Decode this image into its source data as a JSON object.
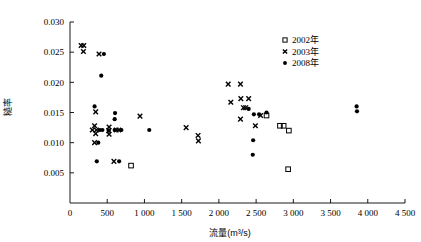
{
  "chart_data": {
    "type": "scatter",
    "title": "",
    "xlabel": "流量(m³/s)",
    "ylabel": "糙率",
    "xlim": [
      0,
      4500
    ],
    "ylim": [
      0,
      0.03
    ],
    "grid": false,
    "legend_position": "top-right",
    "xticks": [
      0,
      500,
      1000,
      1500,
      2000,
      2500,
      3000,
      3500,
      4000,
      4500
    ],
    "xticklabels": [
      "0",
      "500",
      "1 000",
      "1 500",
      "2 000",
      "2 500",
      "3 000",
      "3 500",
      "4 000",
      "4 500"
    ],
    "yticks": [
      0.005,
      0.01,
      0.015,
      0.02,
      0.025,
      0.03
    ],
    "yticklabels": [
      "0.005",
      "0.010",
      "0.015",
      "0.020",
      "0.025",
      "0.030"
    ],
    "series": [
      {
        "name": "2002年",
        "marker": "square",
        "color": "#000000",
        "points": [
          [
            820,
            0.0062
          ],
          [
            2640,
            0.0145
          ],
          [
            2820,
            0.0128
          ],
          [
            2870,
            0.0128
          ],
          [
            2940,
            0.012
          ],
          [
            2930,
            0.0056
          ]
        ]
      },
      {
        "name": "2003年",
        "marker": "x",
        "color": "#000000",
        "points": [
          [
            150,
            0.0261
          ],
          [
            185,
            0.0261
          ],
          [
            180,
            0.0251
          ],
          [
            390,
            0.0247
          ],
          [
            345,
            0.0151
          ],
          [
            330,
            0.0128
          ],
          [
            300,
            0.0121
          ],
          [
            355,
            0.0121
          ],
          [
            345,
            0.0115
          ],
          [
            330,
            0.01
          ],
          [
            520,
            0.012
          ],
          [
            525,
            0.0126
          ],
          [
            525,
            0.0114
          ],
          [
            620,
            0.0121
          ],
          [
            655,
            0.0121
          ],
          [
            590,
            0.0069
          ],
          [
            940,
            0.0144
          ],
          [
            1560,
            0.0125
          ],
          [
            1720,
            0.0112
          ],
          [
            1725,
            0.0103
          ],
          [
            2125,
            0.0197
          ],
          [
            2290,
            0.0197
          ],
          [
            2295,
            0.0173
          ],
          [
            2400,
            0.0173
          ],
          [
            2160,
            0.0167
          ],
          [
            2330,
            0.0158
          ],
          [
            2360,
            0.0158
          ],
          [
            2290,
            0.0139
          ],
          [
            2490,
            0.0128
          ],
          [
            2560,
            0.0145
          ]
        ]
      },
      {
        "name": "2008年",
        "marker": "dot",
        "color": "#000000",
        "points": [
          [
            455,
            0.0247
          ],
          [
            420,
            0.0211
          ],
          [
            330,
            0.016
          ],
          [
            605,
            0.0149
          ],
          [
            600,
            0.0139
          ],
          [
            400,
            0.0121
          ],
          [
            435,
            0.0121
          ],
          [
            520,
            0.012
          ],
          [
            600,
            0.0121
          ],
          [
            690,
            0.0121
          ],
          [
            380,
            0.01
          ],
          [
            360,
            0.0069
          ],
          [
            660,
            0.0069
          ],
          [
            1065,
            0.0121
          ],
          [
            2400,
            0.0156
          ],
          [
            2470,
            0.0147
          ],
          [
            2540,
            0.0147
          ],
          [
            2640,
            0.015
          ],
          [
            2460,
            0.0104
          ],
          [
            2455,
            0.008
          ],
          [
            3850,
            0.016
          ],
          [
            3855,
            0.0152
          ]
        ]
      }
    ]
  },
  "legend": {
    "entries": [
      {
        "marker": "square",
        "label": "2002年"
      },
      {
        "marker": "x",
        "label": "2003年"
      },
      {
        "marker": "dot",
        "label": "2008年"
      }
    ]
  }
}
